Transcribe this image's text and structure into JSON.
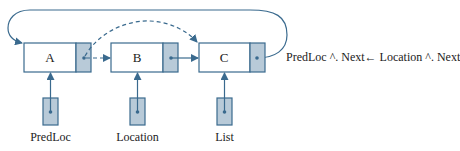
{
  "colors": {
    "stroke": "#3a6a8e",
    "pointer_fill": "#b8cad8",
    "node_fill": "#ffffff",
    "text": "#222222"
  },
  "nodes": [
    {
      "id": "A",
      "label": "A"
    },
    {
      "id": "B",
      "label": "B"
    },
    {
      "id": "C",
      "label": "C"
    }
  ],
  "pointers": [
    {
      "id": "predloc",
      "label": "PredLoc",
      "points_to": "A"
    },
    {
      "id": "location",
      "label": "Location",
      "points_to": "B"
    },
    {
      "id": "list",
      "label": "List",
      "points_to": "C"
    }
  ],
  "links": [
    {
      "from": "A",
      "to": "B",
      "style": "dashed"
    },
    {
      "from": "A",
      "to": "C",
      "style": "dashed-arc"
    },
    {
      "from": "B",
      "to": "C",
      "style": "solid"
    },
    {
      "from": "C",
      "to": "A",
      "style": "solid-loop"
    }
  ],
  "statement": "PredLoc ^. Next←  Location ^. Next"
}
